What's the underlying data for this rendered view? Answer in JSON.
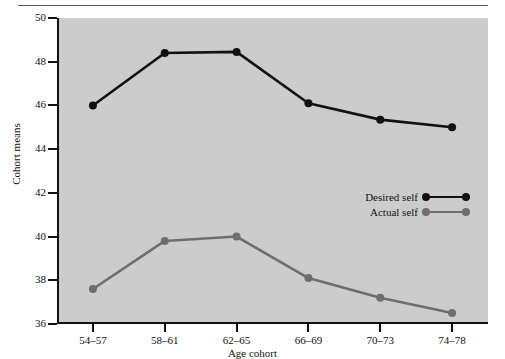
{
  "figure": {
    "background": "#ffffff",
    "plot_background": "#cccccc",
    "top_rule": true
  },
  "chart_data": {
    "type": "line",
    "title": "",
    "xlabel": "Age cohort",
    "ylabel": "Cohort means",
    "categories": [
      "54–57",
      "58–61",
      "62–65",
      "66–69",
      "70–73",
      "74–78"
    ],
    "ylim": [
      36,
      50
    ],
    "yticks": [
      36,
      38,
      40,
      42,
      44,
      46,
      48,
      50
    ],
    "ytick_labels": [
      "36",
      "38",
      "40",
      "42",
      "44",
      "46",
      "48",
      "50"
    ],
    "grid": false,
    "legend_position": "center-right",
    "series": [
      {
        "name": "Desired self",
        "color": "#111111",
        "marker": "circle",
        "values": [
          46.0,
          48.4,
          48.45,
          46.1,
          45.35,
          45.0
        ]
      },
      {
        "name": "Actual self",
        "color": "#6e6e6e",
        "marker": "circle",
        "values": [
          37.6,
          39.8,
          40.0,
          38.1,
          37.2,
          36.5
        ]
      }
    ]
  },
  "legend": {
    "items": [
      {
        "label": "Desired self",
        "color": "#111111"
      },
      {
        "label": "Actual self",
        "color": "#6e6e6e"
      }
    ]
  }
}
